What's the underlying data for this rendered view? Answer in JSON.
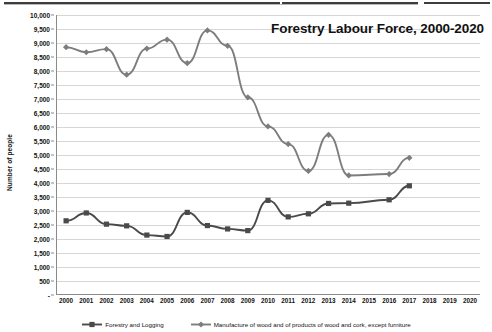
{
  "window": {
    "toolbar_remnant": "cropped-toolbar-strip"
  },
  "chart_data": {
    "type": "line",
    "title": "Forestry Labour Force, 2000-2020",
    "xlabel": "",
    "ylabel": "Number of people",
    "ylim": [
      0,
      10000
    ],
    "grid": true,
    "legend_position": "bottom",
    "categories": [
      "2000",
      "2001",
      "2002",
      "2003",
      "2004",
      "2005",
      "2006",
      "2007",
      "2008",
      "2009",
      "2010",
      "2011",
      "2012",
      "2013",
      "2014",
      "2015",
      "2016",
      "2017",
      "2018",
      "2019",
      "2020"
    ],
    "ytick_labels": [
      "-",
      "500",
      "1,000",
      "1,500",
      "2,000",
      "2,500",
      "3,000",
      "3,500",
      "4,000",
      "4,500",
      "5,000",
      "5,500",
      "6,000",
      "6,500",
      "7,000",
      "7,500",
      "8,000",
      "8,500",
      "9,000",
      "9,500",
      "10,000"
    ],
    "ytick_values": [
      0,
      500,
      1000,
      1500,
      2000,
      2500,
      3000,
      3500,
      4000,
      4500,
      5000,
      5500,
      6000,
      6500,
      7000,
      7500,
      8000,
      8500,
      9000,
      9500,
      10000
    ],
    "series": [
      {
        "name": "Forestry and Logging",
        "marker": "square",
        "color": "#4a4a4a",
        "values": [
          2650,
          2930,
          2530,
          2470,
          2140,
          2090,
          2950,
          2480,
          2360,
          2300,
          3380,
          2790,
          2900,
          3270,
          3280,
          null,
          3400,
          3900,
          null,
          null,
          null
        ]
      },
      {
        "name": "Manufacture of wood and of products of wood and cork, except furniture",
        "marker": "diamond",
        "color": "#7d7d7d",
        "values": [
          8850,
          8670,
          8780,
          7870,
          8800,
          9120,
          8280,
          9450,
          8900,
          7060,
          6020,
          5390,
          4430,
          5720,
          4270,
          null,
          4320,
          4900,
          null,
          null,
          null
        ]
      }
    ]
  }
}
